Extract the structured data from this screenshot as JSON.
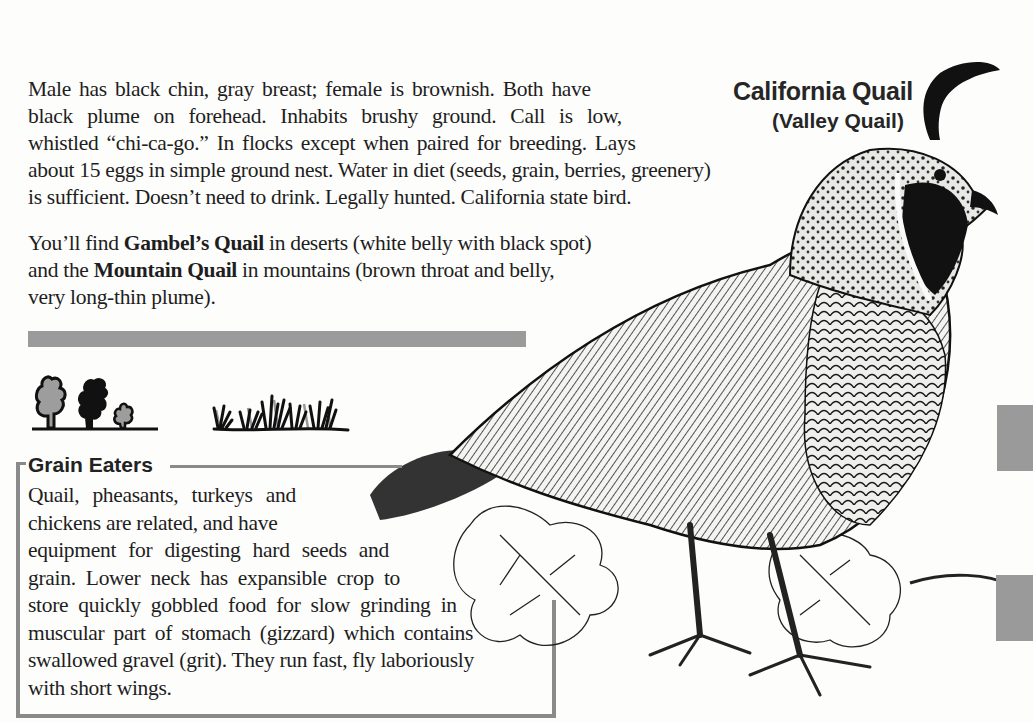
{
  "title": {
    "name": "California Quail",
    "alt_name": "(Valley Quail)"
  },
  "intro": {
    "lines": [
      "Male has black chin, gray breast; female is brownish. Both have",
      "black plume on forehead. Inhabits brushy ground. Call is low,",
      "whistled “chi-ca-go.” In flocks except when paired for breeding. Lays",
      "about 15 eggs in simple ground nest. Water in diet (seeds, grain, berries, greenery)",
      "is sufficient. Doesn’t need to drink. Legally hunted. California state bird."
    ]
  },
  "relatives": {
    "line1_pre": "You’ll find ",
    "line1_bold": "Gambel’s Quail",
    "line1_post": " in deserts (white belly with black spot)",
    "line2_pre": "and the ",
    "line2_bold": "Mountain Quail",
    "line2_post": " in mountains (brown throat and belly,",
    "line3": "very long-thin plume)."
  },
  "habitat": {
    "icons": [
      "trees-icon",
      "grass-icon"
    ]
  },
  "grain_eaters": {
    "heading": "Grain Eaters",
    "lines": [
      "Quail, pheasants, turkeys and",
      "chickens are related, and have",
      "equipment for digesting hard seeds and",
      "grain. Lower neck has expansible crop to",
      "store quickly gobbled food for slow grinding in",
      "muscular part of stomach (gizzard) which contains",
      "swallowed gravel (grit). They run fast, fly laboriously",
      "with short wings."
    ]
  },
  "colors": {
    "page": "#fdfdfc",
    "text": "#1e1e1e",
    "accent_gray": "#9b9b9b",
    "rule_gray": "#8a8a8a"
  }
}
